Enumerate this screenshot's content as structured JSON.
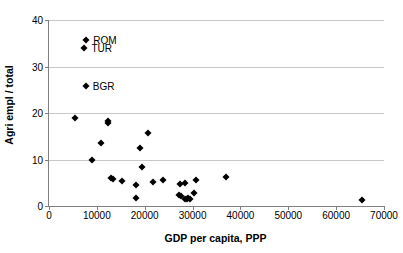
{
  "chart_data": {
    "type": "scatter",
    "title": "",
    "xlabel": "GDP per capita, PPP",
    "ylabel": "Agri empl / total",
    "xlim": [
      0,
      70000
    ],
    "ylim": [
      0,
      40
    ],
    "xticks": [
      0,
      10000,
      20000,
      30000,
      40000,
      50000,
      60000,
      70000
    ],
    "xtick_labels": [
      "0",
      "10000",
      "20000",
      "30000",
      "40000",
      "50000",
      "60000",
      "70000"
    ],
    "yticks": [
      0,
      10,
      20,
      30,
      40
    ],
    "ytick_labels": [
      "0",
      "10",
      "20",
      "30",
      "40"
    ],
    "grid": "horizontal",
    "legend": "none",
    "marker": "diamond",
    "marker_color": "#000000",
    "points": [
      {
        "x": 7800,
        "y": 35.8,
        "label": "ROM"
      },
      {
        "x": 7400,
        "y": 34.0,
        "label": "TUR"
      },
      {
        "x": 7700,
        "y": 25.8,
        "label": "BGR"
      },
      {
        "x": 5500,
        "y": 18.9,
        "label": ""
      },
      {
        "x": 12300,
        "y": 18.3,
        "label": ""
      },
      {
        "x": 12400,
        "y": 17.9,
        "label": ""
      },
      {
        "x": 20700,
        "y": 15.7,
        "label": ""
      },
      {
        "x": 10800,
        "y": 13.6,
        "label": ""
      },
      {
        "x": 19000,
        "y": 12.5,
        "label": ""
      },
      {
        "x": 9000,
        "y": 9.9,
        "label": ""
      },
      {
        "x": 19400,
        "y": 8.4,
        "label": ""
      },
      {
        "x": 12900,
        "y": 6.1,
        "label": ""
      },
      {
        "x": 13300,
        "y": 5.8,
        "label": ""
      },
      {
        "x": 15200,
        "y": 5.4,
        "label": ""
      },
      {
        "x": 18100,
        "y": 4.5,
        "label": ""
      },
      {
        "x": 21800,
        "y": 5.2,
        "label": ""
      },
      {
        "x": 23900,
        "y": 5.5,
        "label": ""
      },
      {
        "x": 27300,
        "y": 4.8,
        "label": ""
      },
      {
        "x": 28400,
        "y": 5.0,
        "label": ""
      },
      {
        "x": 30700,
        "y": 5.5,
        "label": ""
      },
      {
        "x": 37000,
        "y": 6.3,
        "label": ""
      },
      {
        "x": 27200,
        "y": 2.4,
        "label": ""
      },
      {
        "x": 27500,
        "y": 2.2,
        "label": ""
      },
      {
        "x": 28500,
        "y": 1.6,
        "label": ""
      },
      {
        "x": 28800,
        "y": 1.5,
        "label": ""
      },
      {
        "x": 29100,
        "y": 1.7,
        "label": ""
      },
      {
        "x": 29400,
        "y": 1.4,
        "label": ""
      },
      {
        "x": 30400,
        "y": 2.9,
        "label": ""
      },
      {
        "x": 18200,
        "y": 1.7,
        "label": ""
      },
      {
        "x": 65500,
        "y": 1.2,
        "label": ""
      }
    ]
  }
}
